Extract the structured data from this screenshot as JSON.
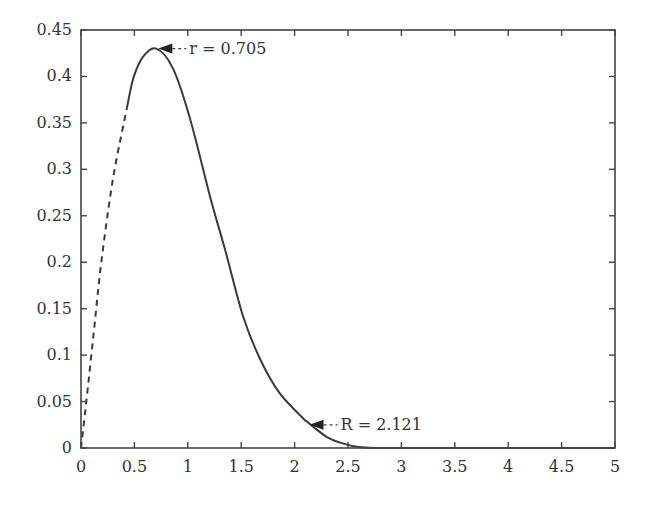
{
  "chart_data": {
    "type": "line",
    "title": "",
    "xlabel": "",
    "ylabel": "",
    "xlim": [
      0,
      5
    ],
    "ylim": [
      0,
      0.45
    ],
    "grid": false,
    "legend": null,
    "x_ticks": [
      "0",
      "0.5",
      "1",
      "1.5",
      "2",
      "2.5",
      "3",
      "3.5",
      "4",
      "4.5",
      "5"
    ],
    "y_ticks": [
      "0",
      "0.05",
      "0.1",
      "0.15",
      "0.2",
      "0.25",
      "0.3",
      "0.35",
      "0.4",
      "0.45"
    ],
    "series": [
      {
        "name": "extrapolated (dashed)",
        "style": "dashed",
        "x": [
          0,
          0.05,
          0.12,
          0.19,
          0.3,
          0.43
        ],
        "y": [
          0,
          0.05,
          0.125,
          0.2,
          0.29,
          0.366
        ]
      },
      {
        "name": "curve (solid)",
        "style": "solid",
        "x": [
          0.43,
          0.49,
          0.58,
          0.705,
          0.86,
          1.02,
          1.21,
          1.35,
          1.52,
          1.68,
          1.86,
          2.08,
          2.121,
          2.3,
          2.45,
          2.6,
          2.8,
          3.0,
          4.0,
          5.0
        ],
        "y": [
          0.366,
          0.398,
          0.421,
          0.43,
          0.409,
          0.355,
          0.27,
          0.213,
          0.141,
          0.095,
          0.059,
          0.032,
          0.028,
          0.012,
          0.005,
          0.001,
          0.0,
          0.0,
          0.0,
          0.0
        ]
      }
    ],
    "annotations": [
      {
        "text": "r = 0.705",
        "x": 0.705,
        "y": 0.43,
        "arrow": "left"
      },
      {
        "text": "R = 2.121",
        "x": 2.121,
        "y": 0.025,
        "arrow": "left"
      }
    ]
  }
}
